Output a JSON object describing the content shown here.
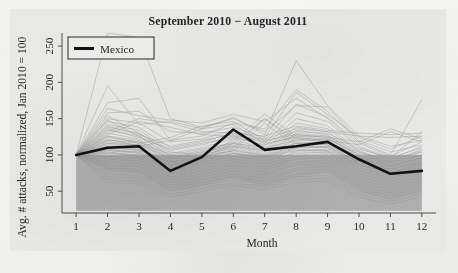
{
  "figure": {
    "title": "September 2010 − August 2011",
    "panel_color": "#ebebe9",
    "band_color": "#b0b0b0",
    "mexico_color": "#111111",
    "background_line_color": "#9a9a9a"
  },
  "axes": {
    "x_label": "Month",
    "y_label": "Avg. # attacks, normalized, Jan 2010 = 100",
    "x_ticks": [
      "1",
      "2",
      "3",
      "4",
      "5",
      "6",
      "7",
      "8",
      "9",
      "10",
      "11",
      "12"
    ],
    "y_ticks": [
      "50",
      "100",
      "150",
      "200",
      "250"
    ]
  },
  "legend": {
    "entries": [
      {
        "label": "Mexico",
        "color": "#111111",
        "marker": "thick-line"
      }
    ]
  },
  "chart_data": {
    "type": "line",
    "title": "September 2010 − August 2011",
    "xlabel": "Month",
    "ylabel": "Avg. # attacks, normalized, Jan 2010 = 100",
    "x": [
      1,
      2,
      3,
      4,
      5,
      6,
      7,
      8,
      9,
      10,
      11,
      12
    ],
    "xlim": [
      0.55,
      12.45
    ],
    "ylim": [
      20,
      268
    ],
    "x_ticks": [
      1,
      2,
      3,
      4,
      5,
      6,
      7,
      8,
      9,
      10,
      11,
      12
    ],
    "y_ticks": [
      50,
      100,
      150,
      200,
      250
    ],
    "grid": false,
    "legend_position": "top-left-inside",
    "annotations": [
      {
        "type": "shaded-band",
        "label": "reference band",
        "y_from": 23,
        "y_to": 100,
        "x_from": 1,
        "x_to": 12,
        "color": "#b0b0b0"
      }
    ],
    "highlight_series": {
      "name": "Mexico",
      "color": "#111111",
      "linewidth": 3,
      "values": [
        100,
        110,
        112,
        78,
        97,
        135,
        107,
        112,
        118,
        94,
        74,
        78
      ]
    },
    "series": [
      {
        "name": "Mexico",
        "color": "#111111",
        "emphasis": true,
        "values": [
          100,
          110,
          112,
          78,
          97,
          135,
          107,
          112,
          118,
          94,
          74,
          78
        ]
      },
      {
        "name": "country-01",
        "color": "#9a9a9a",
        "values": [
          100,
          268,
          262,
          150,
          138,
          150,
          132,
          168,
          166,
          120,
          104,
          114
        ]
      },
      {
        "name": "country-02",
        "color": "#9a9a9a",
        "values": [
          100,
          195,
          142,
          146,
          136,
          152,
          128,
          230,
          168,
          126,
          112,
          120
        ]
      },
      {
        "name": "country-03",
        "color": "#9a9a9a",
        "values": [
          100,
          172,
          178,
          120,
          126,
          144,
          136,
          190,
          160,
          118,
          100,
          176
        ]
      },
      {
        "name": "country-04",
        "color": "#9a9a9a",
        "values": [
          100,
          164,
          154,
          148,
          144,
          156,
          146,
          178,
          150,
          112,
          96,
          132
        ]
      },
      {
        "name": "country-05",
        "color": "#9a9a9a",
        "values": [
          100,
          158,
          160,
          132,
          130,
          138,
          124,
          186,
          156,
          124,
          108,
          126
        ]
      },
      {
        "name": "country-06",
        "color": "#9a9a9a",
        "values": [
          100,
          150,
          144,
          118,
          122,
          134,
          120,
          170,
          152,
          116,
          98,
          118
        ]
      },
      {
        "name": "country-07",
        "color": "#9a9a9a",
        "values": [
          100,
          146,
          138,
          110,
          118,
          130,
          116,
          158,
          146,
          110,
          94,
          112
        ]
      },
      {
        "name": "country-08",
        "color": "#9a9a9a",
        "values": [
          100,
          142,
          134,
          106,
          114,
          126,
          112,
          150,
          140,
          106,
          90,
          108
        ]
      },
      {
        "name": "country-09",
        "color": "#9a9a9a",
        "values": [
          100,
          138,
          130,
          102,
          110,
          122,
          108,
          144,
          136,
          104,
          88,
          104
        ]
      },
      {
        "name": "country-10",
        "color": "#9a9a9a",
        "values": [
          100,
          134,
          126,
          98,
          106,
          118,
          106,
          138,
          132,
          100,
          86,
          100
        ]
      },
      {
        "name": "country-11",
        "color": "#9a9a9a",
        "values": [
          100,
          130,
          122,
          96,
          104,
          116,
          104,
          134,
          128,
          98,
          84,
          98
        ]
      },
      {
        "name": "country-12",
        "color": "#9a9a9a",
        "values": [
          100,
          126,
          120,
          94,
          102,
          114,
          102,
          130,
          126,
          96,
          82,
          96
        ]
      },
      {
        "name": "country-13",
        "color": "#9a9a9a",
        "values": [
          100,
          124,
          118,
          92,
          100,
          112,
          100,
          128,
          124,
          94,
          80,
          94
        ]
      },
      {
        "name": "country-14",
        "color": "#9a9a9a",
        "values": [
          100,
          120,
          116,
          90,
          98,
          110,
          98,
          124,
          120,
          92,
          78,
          92
        ]
      },
      {
        "name": "country-15",
        "color": "#9a9a9a",
        "values": [
          100,
          118,
          114,
          88,
          96,
          108,
          96,
          122,
          118,
          90,
          76,
          90
        ]
      },
      {
        "name": "country-16",
        "color": "#9a9a9a",
        "values": [
          100,
          116,
          112,
          86,
          94,
          106,
          94,
          118,
          116,
          88,
          74,
          88
        ]
      },
      {
        "name": "country-17",
        "color": "#9a9a9a",
        "values": [
          100,
          114,
          110,
          84,
          92,
          104,
          92,
          116,
          114,
          86,
          72,
          86
        ]
      },
      {
        "name": "country-18",
        "color": "#9a9a9a",
        "values": [
          100,
          112,
          108,
          82,
          90,
          102,
          90,
          112,
          112,
          84,
          70,
          84
        ]
      },
      {
        "name": "country-19",
        "color": "#9a9a9a",
        "values": [
          100,
          110,
          106,
          80,
          88,
          100,
          88,
          110,
          110,
          82,
          68,
          82
        ]
      },
      {
        "name": "country-20",
        "color": "#9a9a9a",
        "values": [
          100,
          108,
          104,
          78,
          86,
          98,
          86,
          106,
          106,
          80,
          66,
          80
        ]
      },
      {
        "name": "country-21",
        "color": "#9a9a9a",
        "values": [
          100,
          106,
          102,
          76,
          84,
          96,
          84,
          104,
          104,
          78,
          64,
          78
        ]
      },
      {
        "name": "country-22",
        "color": "#9a9a9a",
        "values": [
          100,
          104,
          100,
          74,
          82,
          94,
          82,
          100,
          102,
          76,
          62,
          76
        ]
      },
      {
        "name": "country-23",
        "color": "#9a9a9a",
        "values": [
          100,
          102,
          98,
          72,
          80,
          92,
          80,
          98,
          100,
          74,
          60,
          74
        ]
      },
      {
        "name": "country-24",
        "color": "#9a9a9a",
        "values": [
          100,
          100,
          96,
          70,
          78,
          90,
          78,
          96,
          98,
          72,
          58,
          72
        ]
      },
      {
        "name": "country-25",
        "color": "#9a9a9a",
        "values": [
          100,
          98,
          94,
          68,
          76,
          88,
          76,
          94,
          96,
          70,
          56,
          70
        ]
      },
      {
        "name": "country-26",
        "color": "#9a9a9a",
        "values": [
          100,
          96,
          92,
          66,
          74,
          86,
          74,
          90,
          94,
          68,
          54,
          68
        ]
      },
      {
        "name": "country-27",
        "color": "#9a9a9a",
        "values": [
          100,
          94,
          90,
          64,
          72,
          84,
          72,
          88,
          92,
          66,
          52,
          66
        ]
      },
      {
        "name": "country-28",
        "color": "#9a9a9a",
        "values": [
          100,
          92,
          88,
          62,
          70,
          82,
          70,
          86,
          90,
          64,
          50,
          64
        ]
      },
      {
        "name": "country-29",
        "color": "#9a9a9a",
        "values": [
          100,
          90,
          86,
          60,
          68,
          80,
          68,
          82,
          88,
          62,
          48,
          62
        ]
      },
      {
        "name": "country-30",
        "color": "#9a9a9a",
        "values": [
          100,
          88,
          84,
          58,
          66,
          78,
          66,
          80,
          86,
          60,
          46,
          60
        ]
      },
      {
        "name": "country-31",
        "color": "#9a9a9a",
        "values": [
          100,
          86,
          82,
          56,
          64,
          76,
          64,
          78,
          84,
          58,
          44,
          58
        ]
      },
      {
        "name": "country-32",
        "color": "#9a9a9a",
        "values": [
          100,
          84,
          80,
          54,
          62,
          74,
          62,
          74,
          82,
          56,
          42,
          56
        ]
      },
      {
        "name": "country-33",
        "color": "#9a9a9a",
        "values": [
          100,
          82,
          78,
          52,
          60,
          72,
          60,
          72,
          80,
          54,
          40,
          54
        ]
      },
      {
        "name": "country-34",
        "color": "#9a9a9a",
        "values": [
          100,
          80,
          76,
          50,
          58,
          70,
          58,
          70,
          78,
          52,
          38,
          52
        ]
      },
      {
        "name": "country-35",
        "color": "#9a9a9a",
        "values": [
          100,
          140,
          128,
          112,
          120,
          128,
          118,
          132,
          130,
          108,
          96,
          110
        ]
      },
      {
        "name": "country-36",
        "color": "#9a9a9a",
        "values": [
          100,
          136,
          124,
          108,
          116,
          124,
          114,
          126,
          126,
          104,
          92,
          106
        ]
      },
      {
        "name": "country-37",
        "color": "#9a9a9a",
        "values": [
          100,
          132,
          150,
          144,
          132,
          130,
          126,
          140,
          134,
          130,
          128,
          130
        ]
      },
      {
        "name": "country-38",
        "color": "#9a9a9a",
        "values": [
          100,
          128,
          146,
          138,
          128,
          126,
          122,
          136,
          132,
          126,
          124,
          126
        ]
      },
      {
        "name": "country-39",
        "color": "#9a9a9a",
        "values": [
          100,
          120,
          118,
          100,
          108,
          116,
          110,
          120,
          122,
          100,
          90,
          100
        ]
      },
      {
        "name": "country-40",
        "color": "#9a9a9a",
        "values": [
          100,
          116,
          114,
          96,
          104,
          112,
          106,
          116,
          118,
          96,
          86,
          96
        ]
      },
      {
        "name": "country-41",
        "color": "#9a9a9a",
        "values": [
          100,
          110,
          108,
          90,
          98,
          106,
          100,
          110,
          112,
          90,
          80,
          90
        ]
      },
      {
        "name": "country-42",
        "color": "#9a9a9a",
        "values": [
          100,
          106,
          104,
          86,
          94,
          102,
          96,
          106,
          108,
          86,
          76,
          86
        ]
      },
      {
        "name": "country-43",
        "color": "#9a9a9a",
        "values": [
          100,
          102,
          100,
          82,
          90,
          98,
          92,
          102,
          104,
          82,
          72,
          82
        ]
      },
      {
        "name": "country-44",
        "color": "#9a9a9a",
        "values": [
          100,
          98,
          96,
          78,
          86,
          94,
          88,
          98,
          100,
          78,
          68,
          78
        ]
      },
      {
        "name": "country-45",
        "color": "#9a9a9a",
        "values": [
          100,
          94,
          92,
          74,
          82,
          90,
          84,
          94,
          96,
          74,
          64,
          74
        ]
      },
      {
        "name": "country-46",
        "color": "#9a9a9a",
        "values": [
          100,
          90,
          88,
          70,
          78,
          86,
          80,
          90,
          92,
          70,
          60,
          70
        ]
      },
      {
        "name": "country-47",
        "color": "#9a9a9a",
        "values": [
          100,
          86,
          84,
          66,
          74,
          82,
          76,
          86,
          88,
          66,
          56,
          66
        ]
      },
      {
        "name": "country-48",
        "color": "#9a9a9a",
        "values": [
          100,
          82,
          80,
          62,
          70,
          78,
          72,
          82,
          84,
          62,
          52,
          62
        ]
      },
      {
        "name": "country-49",
        "color": "#9a9a9a",
        "values": [
          100,
          78,
          76,
          58,
          66,
          74,
          68,
          78,
          80,
          58,
          48,
          58
        ]
      },
      {
        "name": "country-50",
        "color": "#9a9a9a",
        "values": [
          100,
          74,
          72,
          54,
          62,
          70,
          64,
          74,
          76,
          54,
          44,
          54
        ]
      },
      {
        "name": "country-51",
        "color": "#9a9a9a",
        "values": [
          100,
          70,
          68,
          50,
          58,
          66,
          60,
          70,
          72,
          50,
          40,
          50
        ]
      },
      {
        "name": "country-52",
        "color": "#9a9a9a",
        "values": [
          100,
          66,
          64,
          46,
          54,
          62,
          56,
          66,
          68,
          46,
          36,
          46
        ]
      },
      {
        "name": "country-53",
        "color": "#9a9a9a",
        "values": [
          100,
          62,
          60,
          42,
          50,
          58,
          52,
          62,
          64,
          42,
          32,
          42
        ]
      },
      {
        "name": "country-54",
        "color": "#9a9a9a",
        "values": [
          100,
          154,
          130,
          104,
          100,
          120,
          156,
          126,
          122,
          102,
          94,
          104
        ]
      },
      {
        "name": "country-55",
        "color": "#9a9a9a",
        "values": [
          100,
          148,
          126,
          100,
          96,
          116,
          150,
          122,
          118,
          98,
          90,
          100
        ]
      },
      {
        "name": "country-56",
        "color": "#9a9a9a",
        "values": [
          100,
          126,
          116,
          124,
          140,
          146,
          120,
          128,
          124,
          118,
          136,
          122
        ]
      },
      {
        "name": "country-57",
        "color": "#9a9a9a",
        "values": [
          100,
          122,
          112,
          120,
          136,
          142,
          116,
          124,
          120,
          114,
          132,
          118
        ]
      },
      {
        "name": "country-58",
        "color": "#9a9a9a",
        "values": [
          100,
          112,
          106,
          94,
          100,
          110,
          150,
          116,
          114,
          94,
          84,
          96
        ]
      },
      {
        "name": "country-59",
        "color": "#9a9a9a",
        "values": [
          100,
          108,
          102,
          90,
          96,
          106,
          144,
          112,
          110,
          90,
          80,
          92
        ]
      },
      {
        "name": "country-60",
        "color": "#9a9a9a",
        "values": [
          100,
          104,
          98,
          86,
          92,
          102,
          98,
          108,
          106,
          86,
          76,
          88
        ]
      }
    ]
  }
}
